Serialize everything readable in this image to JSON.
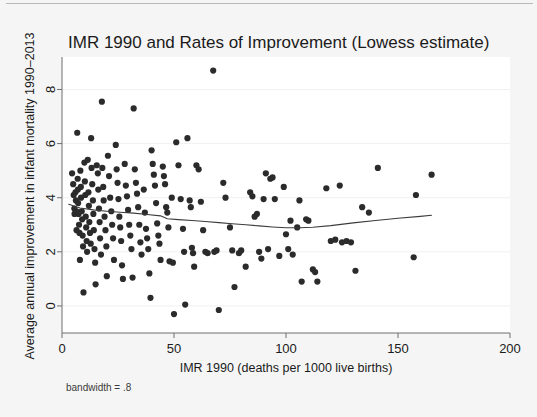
{
  "figure": {
    "background_color": "#f5f5f5",
    "plot_background_color": "#ffffff",
    "marker_color": "#2b2b2b",
    "line_color": "#3c3c3c",
    "axis_color": "#6f6f6f",
    "note": "bandwidth = .8"
  },
  "chart_data": {
    "type": "scatter",
    "title": "IMR 1990 and Rates of Improvement (Lowess estimate)",
    "xlabel": "IMR 1990 (deaths per 1000 live births)",
    "ylabel": "Average annual improvement in infant mortality 1990–2013",
    "xlim": [
      0,
      200
    ],
    "ylim": [
      -1,
      9.2
    ],
    "xticks": [
      0,
      50,
      100,
      150,
      200
    ],
    "xtick_labels": [
      "0",
      "50",
      "100",
      "150",
      "200"
    ],
    "yticks": [
      0,
      2,
      4,
      6,
      8
    ],
    "ytick_labels": [
      "0",
      "2",
      "4",
      "6",
      "8"
    ],
    "grid": "horizontal-faint",
    "legend": "none",
    "annotation": "bandwidth = .8",
    "series": [
      {
        "name": "Countries",
        "marker": "filled-circle",
        "points": [
          [
            4.5,
            4.9
          ],
          [
            5.0,
            4.5
          ],
          [
            5.2,
            4.1
          ],
          [
            5.5,
            3.6
          ],
          [
            5.6,
            3.4
          ],
          [
            6.0,
            4.2
          ],
          [
            6.2,
            3.9
          ],
          [
            6.4,
            3.5
          ],
          [
            6.5,
            2.8
          ],
          [
            6.8,
            6.4
          ],
          [
            7.0,
            4.7
          ],
          [
            7.1,
            4.3
          ],
          [
            7.2,
            3.8
          ],
          [
            7.4,
            3.4
          ],
          [
            7.6,
            3.0
          ],
          [
            7.8,
            2.7
          ],
          [
            8.0,
            1.7
          ],
          [
            8.2,
            5.0
          ],
          [
            8.4,
            4.4
          ],
          [
            8.5,
            4.0
          ],
          [
            8.8,
            3.5
          ],
          [
            9.0,
            3.2
          ],
          [
            9.2,
            2.6
          ],
          [
            9.4,
            2.2
          ],
          [
            9.6,
            0.5
          ],
          [
            10.0,
            5.3
          ],
          [
            10.2,
            4.6
          ],
          [
            10.4,
            4.1
          ],
          [
            10.6,
            3.3
          ],
          [
            10.8,
            2.9
          ],
          [
            11.0,
            2.4
          ],
          [
            11.2,
            2.0
          ],
          [
            11.5,
            5.4
          ],
          [
            11.8,
            4.2
          ],
          [
            12.0,
            3.7
          ],
          [
            12.2,
            3.1
          ],
          [
            12.5,
            2.7
          ],
          [
            12.8,
            2.3
          ],
          [
            13.0,
            6.2
          ],
          [
            13.2,
            5.1
          ],
          [
            13.5,
            4.5
          ],
          [
            13.8,
            3.9
          ],
          [
            14.0,
            3.4
          ],
          [
            14.2,
            2.8
          ],
          [
            14.5,
            2.1
          ],
          [
            14.8,
            1.6
          ],
          [
            15.0,
            0.8
          ],
          [
            15.5,
            5.2
          ],
          [
            16.0,
            4.9
          ],
          [
            16.2,
            4.3
          ],
          [
            16.5,
            3.6
          ],
          [
            16.8,
            3.1
          ],
          [
            17.0,
            2.5
          ],
          [
            17.4,
            1.9
          ],
          [
            17.8,
            7.55
          ],
          [
            18.0,
            5.1
          ],
          [
            18.4,
            4.4
          ],
          [
            18.6,
            3.9
          ],
          [
            19.0,
            3.3
          ],
          [
            19.4,
            2.8
          ],
          [
            19.8,
            2.2
          ],
          [
            20.0,
            1.1
          ],
          [
            20.5,
            5.55
          ],
          [
            21.0,
            4.8
          ],
          [
            21.5,
            4.0
          ],
          [
            22.0,
            3.5
          ],
          [
            22.4,
            3.0
          ],
          [
            22.8,
            2.5
          ],
          [
            23.2,
            1.7
          ],
          [
            24.0,
            5.95
          ],
          [
            24.4,
            5.05
          ],
          [
            24.8,
            4.55
          ],
          [
            25.2,
            3.95
          ],
          [
            25.6,
            3.3
          ],
          [
            26.0,
            2.9
          ],
          [
            26.4,
            2.4
          ],
          [
            26.8,
            1.5
          ],
          [
            27.2,
            1.0
          ],
          [
            28.0,
            5.25
          ],
          [
            28.5,
            4.45
          ],
          [
            29.0,
            4.05
          ],
          [
            29.5,
            3.55
          ],
          [
            30.0,
            3.0
          ],
          [
            30.5,
            2.6
          ],
          [
            31.0,
            2.1
          ],
          [
            31.5,
            1.05
          ],
          [
            32.0,
            7.3
          ],
          [
            32.5,
            5.05
          ],
          [
            33.0,
            4.55
          ],
          [
            33.5,
            4.15
          ],
          [
            34.0,
            3.65
          ],
          [
            34.5,
            3.0
          ],
          [
            35.0,
            2.35
          ],
          [
            35.5,
            1.9
          ],
          [
            36.5,
            4.3
          ],
          [
            37.0,
            3.45
          ],
          [
            37.5,
            2.85
          ],
          [
            38.0,
            2.5
          ],
          [
            38.5,
            2.1
          ],
          [
            39.0,
            1.2
          ],
          [
            39.5,
            0.3
          ],
          [
            40.0,
            5.75
          ],
          [
            40.5,
            5.25
          ],
          [
            41.0,
            4.85
          ],
          [
            41.5,
            4.45
          ],
          [
            42.0,
            3.8
          ],
          [
            42.5,
            3.05
          ],
          [
            43.0,
            2.6
          ],
          [
            43.5,
            2.3
          ],
          [
            44.0,
            1.7
          ],
          [
            45.0,
            5.15
          ],
          [
            45.5,
            4.8
          ],
          [
            46.0,
            4.5
          ],
          [
            46.5,
            3.65
          ],
          [
            47.0,
            3.45
          ],
          [
            47.5,
            2.9
          ],
          [
            48.0,
            1.65
          ],
          [
            49.0,
            4.0
          ],
          [
            49.5,
            1.6
          ],
          [
            50.0,
            -0.3
          ],
          [
            51.0,
            6.05
          ],
          [
            52.0,
            5.2
          ],
          [
            53.0,
            3.95
          ],
          [
            54.0,
            2.85
          ],
          [
            54.5,
            2.0
          ],
          [
            55.0,
            0.05
          ],
          [
            56.0,
            6.2
          ],
          [
            57.0,
            3.9
          ],
          [
            57.5,
            3.65
          ],
          [
            58.0,
            2.15
          ],
          [
            58.5,
            1.95
          ],
          [
            59.0,
            1.45
          ],
          [
            60.0,
            5.2
          ],
          [
            61.0,
            5.05
          ],
          [
            62.0,
            3.85
          ],
          [
            63.0,
            2.8
          ],
          [
            64.0,
            2.0
          ],
          [
            65.0,
            1.95
          ],
          [
            67.5,
            8.7
          ],
          [
            68.0,
            2.0
          ],
          [
            69.0,
            2.05
          ],
          [
            70.0,
            -0.15
          ],
          [
            72.0,
            4.55
          ],
          [
            73.0,
            4.0
          ],
          [
            75.0,
            2.9
          ],
          [
            76.0,
            2.05
          ],
          [
            77.0,
            0.7
          ],
          [
            79.0,
            1.95
          ],
          [
            80.0,
            2.05
          ],
          [
            82.0,
            1.45
          ],
          [
            84.0,
            4.2
          ],
          [
            85.0,
            4.05
          ],
          [
            86.0,
            3.3
          ],
          [
            87.0,
            3.4
          ],
          [
            88.0,
            2.0
          ],
          [
            89.0,
            1.75
          ],
          [
            90.0,
            3.95
          ],
          [
            91.0,
            4.9
          ],
          [
            92.0,
            2.1
          ],
          [
            93.0,
            4.7
          ],
          [
            94.0,
            4.75
          ],
          [
            95.0,
            3.95
          ],
          [
            97.0,
            1.85
          ],
          [
            99.0,
            4.4
          ],
          [
            100.0,
            2.65
          ],
          [
            101.0,
            2.1
          ],
          [
            102.0,
            3.15
          ],
          [
            103.0,
            1.9
          ],
          [
            105.0,
            2.9
          ],
          [
            106.0,
            3.9
          ],
          [
            107.0,
            0.9
          ],
          [
            109.0,
            3.2
          ],
          [
            110.0,
            3.15
          ],
          [
            112.0,
            1.35
          ],
          [
            113.0,
            1.25
          ],
          [
            114.0,
            0.9
          ],
          [
            118.0,
            4.35
          ],
          [
            120.0,
            2.4
          ],
          [
            122.0,
            2.45
          ],
          [
            124.0,
            4.45
          ],
          [
            125.0,
            2.35
          ],
          [
            127.0,
            2.4
          ],
          [
            129.0,
            2.35
          ],
          [
            131.0,
            1.3
          ],
          [
            134.0,
            3.65
          ],
          [
            137.0,
            3.45
          ],
          [
            141.0,
            5.1
          ],
          [
            157.0,
            1.8
          ],
          [
            158.0,
            4.1
          ],
          [
            165.0,
            4.85
          ]
        ]
      }
    ],
    "lowess": {
      "name": "Lowess smoother",
      "bandwidth": 0.8,
      "points": [
        [
          3.0,
          3.76
        ],
        [
          8.0,
          3.62
        ],
        [
          14.0,
          3.55
        ],
        [
          20.0,
          3.5
        ],
        [
          26.0,
          3.46
        ],
        [
          32.0,
          3.43
        ],
        [
          38.0,
          3.38
        ],
        [
          44.0,
          3.33
        ],
        [
          47.0,
          3.22
        ],
        [
          52.0,
          3.19
        ],
        [
          58.0,
          3.16
        ],
        [
          64.0,
          3.12
        ],
        [
          70.0,
          3.08
        ],
        [
          76.0,
          3.04
        ],
        [
          82.0,
          3.0
        ],
        [
          88.0,
          2.96
        ],
        [
          94.0,
          2.92
        ],
        [
          100.0,
          2.89
        ],
        [
          106.0,
          2.89
        ],
        [
          112.0,
          2.91
        ],
        [
          120.0,
          2.97
        ],
        [
          130.0,
          3.07
        ],
        [
          140.0,
          3.16
        ],
        [
          150.0,
          3.24
        ],
        [
          160.0,
          3.31
        ],
        [
          165.0,
          3.35
        ]
      ]
    }
  }
}
